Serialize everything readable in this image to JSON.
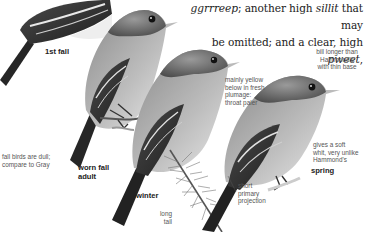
{
  "text": {
    "line1": [
      {
        "t": "ggrrreep",
        "i": true
      },
      {
        "t": "; another high ",
        "i": false
      },
      {
        "t": "sillit",
        "i": true
      },
      {
        "t": " that may",
        "i": false
      }
    ],
    "line2": [
      {
        "t": "be omitted; and a clear, high ",
        "i": false
      },
      {
        "t": "pweet",
        "i": true
      },
      {
        "t": ",",
        "i": false
      }
    ]
  },
  "figure": {
    "labels": {
      "first_fall": "1st fall",
      "worn_fall_adult_1": "worn fall",
      "worn_fall_adult_2": "adult",
      "winter": "winter",
      "spring": "spring"
    },
    "annotations": {
      "bill": [
        "bill longer than",
        "Hammond's",
        "with thin base"
      ],
      "yellow": [
        "mainly yellow",
        "below in fresh",
        "plumage:",
        "throat paler"
      ],
      "fall_dull": [
        "fall birds are dull;",
        "compare to Gray"
      ],
      "soft_whit": [
        "gives a soft",
        "whit, very unlike",
        "Hammond's"
      ],
      "primary": [
        "short",
        "primary",
        "projection"
      ],
      "tail": [
        "long",
        "tail"
      ]
    },
    "colors": {
      "ink": "#222222",
      "label_gray": "#555555",
      "bird_dark": "#2a2a2a",
      "bird_mid": "#6e6e6e",
      "bird_light": "#d8d8d8"
    }
  }
}
